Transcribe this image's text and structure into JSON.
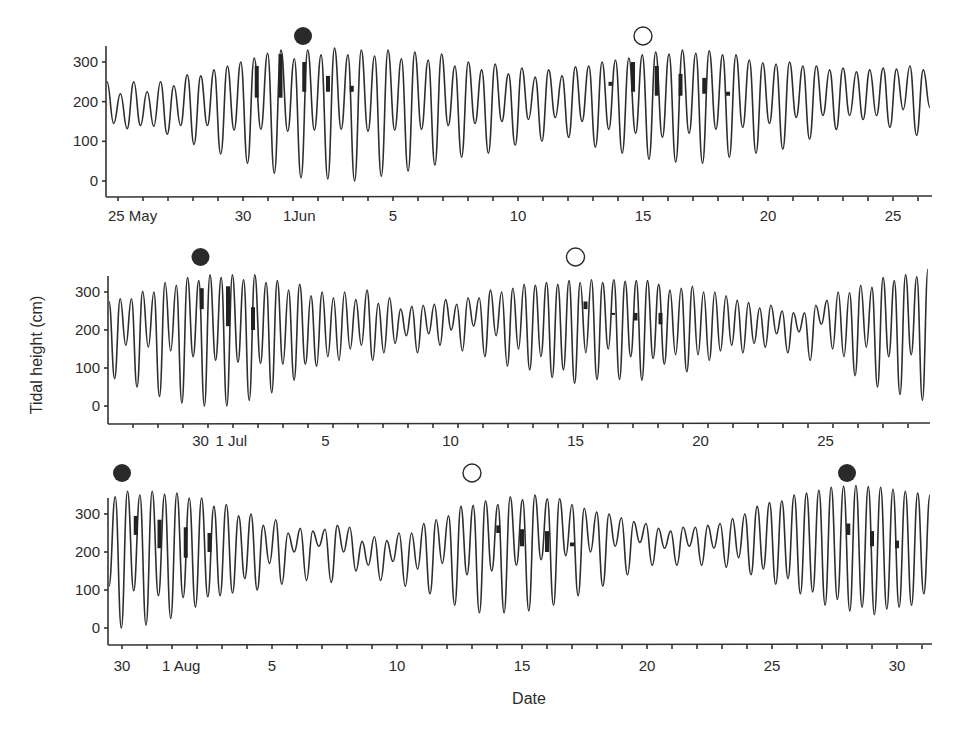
{
  "chart_data": {
    "type": "line",
    "title": "",
    "xlabel": "Date",
    "ylabel": "Tidal height (cm)",
    "legend": {
      "new_moon": "filled circle",
      "full_moon": "open circle"
    },
    "panels": [
      {
        "name": "May-June",
        "ylim": [
          -40,
          350
        ],
        "yticks": [
          0,
          100,
          200,
          300
        ],
        "x_tick_labels": [
          {
            "day": 0,
            "label": "25 May"
          },
          {
            "day": 5,
            "label": "30"
          },
          {
            "day": 7,
            "label": "1Jun"
          },
          {
            "day": 11,
            "label": "5"
          },
          {
            "day": 16,
            "label": "10"
          },
          {
            "day": 21,
            "label": "15"
          },
          {
            "day": 26,
            "label": "20"
          },
          {
            "day": 31,
            "label": "25"
          }
        ],
        "day_range": [
          -0.45,
          32.6
        ],
        "moons": [
          {
            "type": "new",
            "day": 7.4
          },
          {
            "type": "full",
            "day": 21.0
          }
        ],
        "marks": [
          {
            "day": 5.55,
            "from": 210,
            "to": 290
          },
          {
            "day": 6.5,
            "from": 210,
            "to": 320
          },
          {
            "day": 7.45,
            "from": 225,
            "to": 300
          },
          {
            "day": 8.4,
            "from": 225,
            "to": 265
          },
          {
            "day": 9.35,
            "from": 225,
            "to": 240
          },
          {
            "day": 19.7,
            "from": 240,
            "to": 250
          },
          {
            "day": 20.6,
            "from": 225,
            "to": 300
          },
          {
            "day": 21.55,
            "from": 215,
            "to": 290
          },
          {
            "day": 22.5,
            "from": 215,
            "to": 270
          },
          {
            "day": 23.45,
            "from": 220,
            "to": 260
          },
          {
            "day": 24.4,
            "from": 215,
            "to": 225
          }
        ],
        "extrema": [
          250,
          145,
          220,
          132,
          250,
          140,
          225,
          138,
          250,
          118,
          240,
          140,
          268,
          92,
          265,
          140,
          280,
          68,
          290,
          128,
          300,
          45,
          310,
          130,
          322,
          20,
          330,
          125,
          308,
          8,
          330,
          128,
          318,
          5,
          335,
          130,
          318,
          0,
          330,
          125,
          315,
          12,
          330,
          128,
          308,
          25,
          325,
          130,
          305,
          40,
          320,
          140,
          290,
          60,
          300,
          145,
          280,
          70,
          295,
          150,
          270,
          90,
          285,
          155,
          262,
          100,
          280,
          160,
          265,
          110,
          288,
          150,
          290,
          85,
          300,
          130,
          305,
          70,
          310,
          120,
          318,
          55,
          325,
          110,
          320,
          48,
          330,
          120,
          322,
          45,
          328,
          130,
          318,
          60,
          318,
          135,
          305,
          70,
          298,
          145,
          295,
          80,
          300,
          160,
          290,
          105,
          290,
          165,
          280,
          130,
          285,
          165,
          275,
          155,
          280,
          165,
          285,
          135,
          282,
          180,
          290,
          115,
          280,
          185
        ]
      },
      {
        "name": "June-July",
        "ylim": [
          -40,
          350
        ],
        "yticks": [
          0,
          100,
          200,
          300
        ],
        "x_tick_labels": [
          {
            "day": 3.7,
            "label": "30"
          },
          {
            "day": 4.7,
            "label": "1 Jul"
          },
          {
            "day": 8.7,
            "label": "5"
          },
          {
            "day": 13.7,
            "label": "10"
          },
          {
            "day": 18.7,
            "label": "15"
          },
          {
            "day": 23.7,
            "label": "20"
          },
          {
            "day": 28.7,
            "label": "25"
          }
        ],
        "day_range": [
          0,
          33.1
        ],
        "moons": [
          {
            "type": "new",
            "day": 3.7
          },
          {
            "type": "full",
            "day": 18.7
          }
        ],
        "marks": [
          {
            "day": 3.75,
            "from": 255,
            "to": 310
          },
          {
            "day": 4.8,
            "from": 210,
            "to": 315
          },
          {
            "day": 5.8,
            "from": 200,
            "to": 260
          },
          {
            "day": 19.1,
            "from": 255,
            "to": 275
          },
          {
            "day": 20.2,
            "from": 240,
            "to": 245
          },
          {
            "day": 21.1,
            "from": 225,
            "to": 245
          },
          {
            "day": 22.1,
            "from": 215,
            "to": 245
          }
        ],
        "extrema": [
          275,
          72,
          282,
          160,
          282,
          50,
          302,
          155,
          300,
          25,
          325,
          145,
          318,
          8,
          338,
          130,
          330,
          0,
          345,
          120,
          338,
          0,
          345,
          115,
          332,
          15,
          345,
          112,
          325,
          35,
          330,
          110,
          305,
          68,
          320,
          110,
          290,
          105,
          300,
          130,
          285,
          120,
          300,
          150,
          280,
          160,
          305,
          120,
          270,
          140,
          285,
          165,
          255,
          185,
          262,
          140,
          265,
          190,
          268,
          160,
          280,
          200,
          268,
          145,
          285,
          210,
          285,
          130,
          305,
          185,
          300,
          105,
          310,
          150,
          320,
          95,
          318,
          130,
          325,
          75,
          320,
          95,
          330,
          60,
          325,
          140,
          332,
          70,
          325,
          150,
          332,
          70,
          328,
          130,
          330,
          68,
          330,
          125,
          320,
          110,
          305,
          135,
          310,
          90,
          315,
          135,
          300,
          120,
          300,
          145,
          290,
          160,
          278,
          140,
          272,
          165,
          258,
          155,
          265,
          190,
          250,
          140,
          245,
          195,
          245,
          120,
          265,
          215,
          278,
          150,
          300,
          130,
          298,
          80,
          318,
          155,
          312,
          50,
          338,
          130,
          330,
          30,
          345,
          135,
          340,
          15,
          360
        ]
      },
      {
        "name": "July-August",
        "ylim": [
          -40,
          360
        ],
        "yticks": [
          0,
          100,
          200,
          300
        ],
        "x_tick_labels": [
          {
            "day": 0,
            "label": "30"
          },
          {
            "day": 2,
            "label": "1 Aug"
          },
          {
            "day": 6,
            "label": "5"
          },
          {
            "day": 11,
            "label": "10"
          },
          {
            "day": 16,
            "label": "15"
          },
          {
            "day": 21,
            "label": "20"
          },
          {
            "day": 26,
            "label": "25"
          },
          {
            "day": 31,
            "label": "30"
          }
        ],
        "day_range": [
          -0.55,
          32.6
        ],
        "moons": [
          {
            "type": "new",
            "day": 0.0
          },
          {
            "type": "full",
            "day": 14.0
          },
          {
            "type": "new",
            "day": 29.0
          }
        ],
        "marks": [
          {
            "day": 0.55,
            "from": 245,
            "to": 295
          },
          {
            "day": 1.5,
            "from": 210,
            "to": 285
          },
          {
            "day": 2.55,
            "from": 185,
            "to": 265
          },
          {
            "day": 3.5,
            "from": 200,
            "to": 250
          },
          {
            "day": 15.05,
            "from": 250,
            "to": 270
          },
          {
            "day": 16.0,
            "from": 215,
            "to": 260
          },
          {
            "day": 17.0,
            "from": 200,
            "to": 255
          },
          {
            "day": 18.0,
            "from": 215,
            "to": 225
          },
          {
            "day": 29.05,
            "from": 245,
            "to": 275
          },
          {
            "day": 30.0,
            "from": 215,
            "to": 255
          },
          {
            "day": 31.0,
            "from": 210,
            "to": 230
          }
        ],
        "extrema": [
          110,
          345,
          0,
          360,
          98,
          350,
          8,
          360,
          85,
          352,
          25,
          355,
          80,
          342,
          55,
          342,
          82,
          320,
          85,
          325,
          92,
          295,
          130,
          300,
          100,
          270,
          170,
          285,
          115,
          250,
          200,
          262,
          125,
          255,
          215,
          260,
          120,
          270,
          200,
          265,
          150,
          228,
          165,
          240,
          125,
          230,
          175,
          250,
          110,
          250,
          155,
          275,
          90,
          285,
          170,
          295,
          60,
          320,
          140,
          322,
          40,
          335,
          150,
          325,
          40,
          345,
          165,
          338,
          45,
          350,
          180,
          340,
          60,
          340,
          190,
          325,
          85,
          315,
          200,
          305,
          110,
          300,
          215,
          290,
          140,
          280,
          225,
          275,
          165,
          262,
          210,
          255,
          165,
          265,
          215,
          265,
          165,
          270,
          210,
          275,
          160,
          288,
          185,
          300,
          140,
          320,
          155,
          330,
          115,
          335,
          130,
          350,
          90,
          355,
          95,
          362,
          60,
          370,
          75,
          373,
          45,
          375,
          55,
          372,
          35,
          370,
          50,
          365,
          55,
          360,
          60,
          355,
          90,
          350
        ]
      }
    ]
  }
}
